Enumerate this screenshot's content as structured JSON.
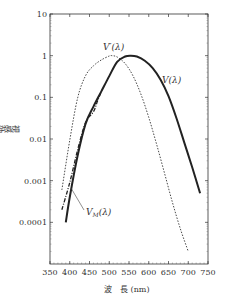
{
  "chart_data": {
    "type": "line",
    "title": "",
    "xlabel": "波　長 (nm)",
    "ylabel": "視感効率",
    "xlim": [
      350,
      750
    ],
    "ylim": [
      1e-05,
      10
    ],
    "yscale": "log",
    "grid": false,
    "x_ticks": [
      350,
      400,
      450,
      500,
      550,
      600,
      650,
      700,
      750
    ],
    "y_ticks": [
      {
        "value": 10,
        "label": "10"
      },
      {
        "value": 1,
        "label": "1"
      },
      {
        "value": 0.1,
        "label": "0.1"
      },
      {
        "value": 0.01,
        "label": "0.01"
      },
      {
        "value": 0.001,
        "label": "0.001"
      },
      {
        "value": 0.0001,
        "label": "0.0001"
      }
    ],
    "series": [
      {
        "name": "V(λ)",
        "style": "solid-thick",
        "color": "#222222",
        "x": [
          390,
          400,
          420,
          440,
          460,
          480,
          500,
          520,
          540,
          555,
          570,
          590,
          610,
          630,
          650,
          670,
          690,
          710,
          730
        ],
        "y": [
          0.0001,
          0.0004,
          0.004,
          0.023,
          0.06,
          0.139,
          0.323,
          0.71,
          0.954,
          1.0,
          0.952,
          0.757,
          0.503,
          0.265,
          0.107,
          0.032,
          0.0082,
          0.0021,
          0.0005
        ]
      },
      {
        "name": "V'(λ)",
        "style": "dotted",
        "color": "#333333",
        "x": [
          380,
          400,
          420,
          440,
          460,
          480,
          500,
          507,
          520,
          540,
          560,
          580,
          600,
          620,
          640,
          660,
          680,
          700
        ],
        "y": [
          0.0006,
          0.0093,
          0.097,
          0.33,
          0.57,
          0.79,
          0.98,
          1.0,
          0.93,
          0.65,
          0.33,
          0.12,
          0.033,
          0.0074,
          0.0015,
          0.0003,
          7e-05,
          2e-05
        ]
      },
      {
        "name": "VM(λ)",
        "style": "dash-dot",
        "color": "#222222",
        "x": [
          380,
          400,
          420,
          440,
          460,
          470,
          480
        ],
        "y": [
          0.0002,
          0.0009,
          0.0055,
          0.025,
          0.045,
          0.08,
          0.139
        ]
      }
    ],
    "annotations": [
      {
        "text": "V'(λ)",
        "x": 470,
        "y": 1.2
      },
      {
        "text": "V(λ)",
        "x": 650,
        "y": 0.6
      },
      {
        "text": "VM(λ)",
        "x": 440,
        "y": 0.0003,
        "leader_to": {
          "x": 405,
          "y": 0.001
        }
      }
    ]
  },
  "labels": {
    "y_axis": "視感効率",
    "x_axis": "波　長 (nm)",
    "v_prime": "V′(λ)",
    "v": "V(λ)",
    "vm_main": "V",
    "vm_sub": "M",
    "vm_tail": "(λ)"
  }
}
